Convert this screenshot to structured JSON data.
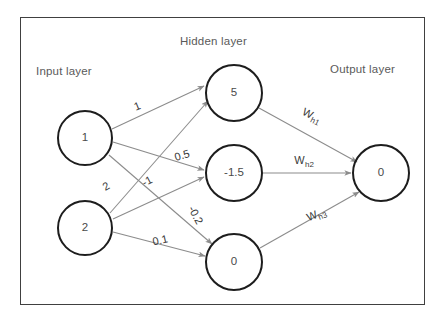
{
  "diagram": {
    "title_visible": false,
    "background_color": "#ffffff",
    "border_color": "#404040",
    "node_stroke_color": "#1d1d1d",
    "edge_color": "#8c8c8c",
    "text_color": "#4a4a4a",
    "layer_title_color": "#5a5a5a"
  },
  "layer_titles": [
    {
      "id": "input",
      "label": "Input layer"
    },
    {
      "id": "hidden",
      "label": "Hidden layer"
    },
    {
      "id": "output",
      "label": "Output layer"
    }
  ],
  "nodes": {
    "input": [
      {
        "id": "i1",
        "value": "1",
        "cx": 85,
        "cy": 138,
        "r": 28
      },
      {
        "id": "i2",
        "value": "2",
        "cx": 85,
        "cy": 228,
        "r": 28
      }
    ],
    "hidden": [
      {
        "id": "h1",
        "value": "5",
        "cx": 234,
        "cy": 93,
        "r": 29
      },
      {
        "id": "h2",
        "value": "-1.5",
        "cx": 234,
        "cy": 173,
        "r": 29
      },
      {
        "id": "h3",
        "value": "0",
        "cx": 234,
        "cy": 262,
        "r": 29
      }
    ],
    "output": [
      {
        "id": "o1",
        "value": "0",
        "cx": 381,
        "cy": 173,
        "r": 29
      }
    ]
  },
  "edge_labels": [
    {
      "id": "w-i1-h1",
      "text": "1",
      "from": "i1",
      "to": "h1",
      "x": 137,
      "y": 106,
      "rotate": -22
    },
    {
      "id": "w-i1-h2",
      "text": "0.5",
      "from": "i1",
      "to": "h2",
      "x": 182,
      "y": 155,
      "rotate": -16
    },
    {
      "id": "w-i2-h1",
      "text": "2",
      "from": "i2",
      "to": "h1",
      "x": 106,
      "y": 186,
      "rotate": -30
    },
    {
      "id": "w-i2-h2",
      "text": "-1",
      "from": "i2",
      "to": "h2",
      "x": 147,
      "y": 181,
      "rotate": -28
    },
    {
      "id": "w-i1-h3",
      "text": "-0.2",
      "from": "i1",
      "to": "h3",
      "x": 196,
      "y": 215,
      "rotate": 62
    },
    {
      "id": "w-i2-h3",
      "text": "0.1",
      "from": "i2",
      "to": "h3",
      "x": 160,
      "y": 240,
      "rotate": -13
    },
    {
      "id": "w-h1-o1",
      "text": "W",
      "sub": "h1",
      "from": "h1",
      "to": "o1",
      "x": 312,
      "y": 115,
      "rotate": 27
    },
    {
      "id": "w-h2-o1",
      "text": "W",
      "sub": "h2",
      "from": "h2",
      "to": "o1",
      "x": 304,
      "y": 160,
      "rotate": 0
    },
    {
      "id": "w-h3-o1",
      "text": "W",
      "sub": "h3",
      "from": "h3",
      "to": "o1",
      "x": 316,
      "y": 214,
      "rotate": -22
    }
  ],
  "edges": [
    {
      "id": "e-i1-h1",
      "x1": 112,
      "y1": 129,
      "x2": 204,
      "y2": 86
    },
    {
      "id": "e-i1-h2",
      "x1": 113,
      "y1": 142,
      "x2": 204,
      "y2": 170
    },
    {
      "id": "e-i1-h3",
      "x1": 109,
      "y1": 155,
      "x2": 212,
      "y2": 244
    },
    {
      "id": "e-i2-h1",
      "x1": 110,
      "y1": 213,
      "x2": 208,
      "y2": 101
    },
    {
      "id": "e-i2-h2",
      "x1": 113,
      "y1": 219,
      "x2": 204,
      "y2": 177
    },
    {
      "id": "e-i2-h3",
      "x1": 113,
      "y1": 232,
      "x2": 205,
      "y2": 256
    },
    {
      "id": "e-h1-o1",
      "x1": 259,
      "y1": 108,
      "x2": 357,
      "y2": 162
    },
    {
      "id": "e-h2-o1",
      "x1": 263,
      "y1": 173,
      "x2": 351,
      "y2": 173
    },
    {
      "id": "e-h3-o1",
      "x1": 260,
      "y1": 248,
      "x2": 359,
      "y2": 192
    }
  ],
  "title_positions": [
    {
      "id": "input",
      "x": 36,
      "y": 65
    },
    {
      "id": "hidden",
      "x": 180,
      "y": 35
    },
    {
      "id": "output",
      "x": 330,
      "y": 63
    }
  ]
}
